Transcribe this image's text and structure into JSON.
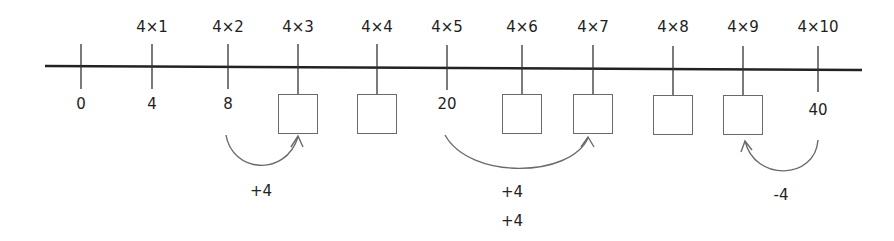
{
  "diagram": {
    "type": "number-line",
    "title": "",
    "colors": {
      "axis": "#222222",
      "box_border": "#6a6a6a",
      "arc": "#6a6a6a",
      "text": "#1e1e1e"
    },
    "ticks": [
      {
        "x": 81,
        "top_label": "",
        "value": "0",
        "blank": false
      },
      {
        "x": 152,
        "top_label": "4×1",
        "value": "4",
        "blank": false
      },
      {
        "x": 228,
        "top_label": "4×2",
        "value": "8",
        "blank": false
      },
      {
        "x": 298,
        "top_label": "4×3",
        "value": "",
        "blank": true
      },
      {
        "x": 377,
        "top_label": "4×4",
        "value": "",
        "blank": true
      },
      {
        "x": 447,
        "top_label": "4×5",
        "value": "20",
        "blank": false
      },
      {
        "x": 522,
        "top_label": "4×6",
        "value": "",
        "blank": true
      },
      {
        "x": 593,
        "top_label": "4×7",
        "value": "",
        "blank": true
      },
      {
        "x": 673,
        "top_label": "4×8",
        "value": "",
        "blank": true
      },
      {
        "x": 743,
        "top_label": "4×9",
        "value": "",
        "blank": true
      },
      {
        "x": 818,
        "top_label": "4×10",
        "value": "40",
        "blank": false
      }
    ],
    "jumps": [
      {
        "from": "8",
        "to": "4×3",
        "labels": [
          "+4"
        ]
      },
      {
        "from": "20",
        "to": "4×7",
        "labels": [
          "+4",
          "+4"
        ]
      },
      {
        "from": "40",
        "to": "4×9",
        "labels": [
          "-4"
        ]
      }
    ],
    "step_labels": {
      "jump1": "+4",
      "jump2a": "+4",
      "jump2b": "+4",
      "jump3": "-4"
    }
  }
}
